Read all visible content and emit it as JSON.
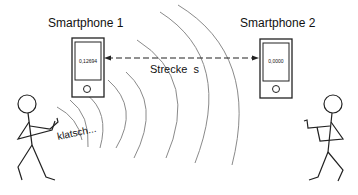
{
  "phone1": {
    "title": "Smartphone 1",
    "value": "0,12694"
  },
  "phone2": {
    "title": "Smartphone 2",
    "value": "0,0000"
  },
  "distance": {
    "label": "Strecke  s"
  },
  "sound": {
    "label": "klatsch..."
  },
  "colors": {
    "stroke": "#222222",
    "wave": "#888888",
    "background": "#ffffff"
  }
}
